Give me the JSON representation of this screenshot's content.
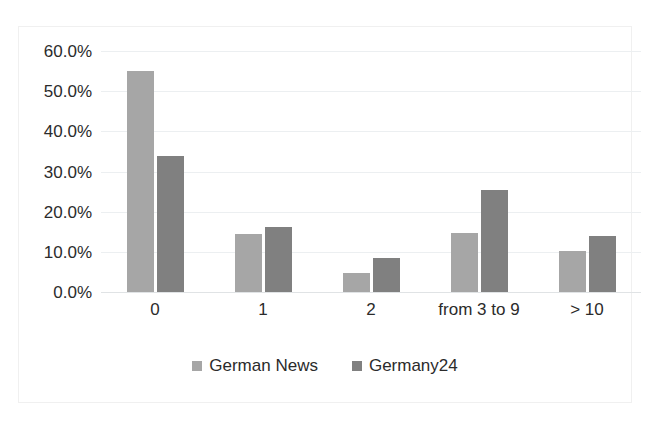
{
  "chart_data": {
    "type": "bar",
    "title": "",
    "subtitle": "",
    "xlabel": "",
    "ylabel": "",
    "categories": [
      "0",
      "1",
      "2",
      "from 3 to 9",
      "> 10"
    ],
    "series": [
      {
        "name": "German News",
        "color": "#a6a6a6",
        "values": [
          55.0,
          14.5,
          4.7,
          14.8,
          10.1
        ]
      },
      {
        "name": "Germany24",
        "color": "#808080",
        "values": [
          33.8,
          16.2,
          8.4,
          25.4,
          14.0
        ]
      }
    ],
    "ylim": [
      0,
      60
    ],
    "yticks": [
      0,
      10,
      20,
      30,
      40,
      50,
      60
    ],
    "ytick_labels": [
      "0.0%",
      "10.0%",
      "20.0%",
      "30.0%",
      "40.0%",
      "50.0%",
      "60.0%"
    ],
    "grid": true,
    "legend_position": "bottom",
    "value_format": "percent"
  },
  "legend": {
    "entries": [
      {
        "label": "German News"
      },
      {
        "label": "Germany24"
      }
    ]
  }
}
